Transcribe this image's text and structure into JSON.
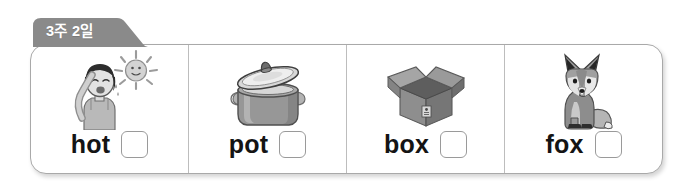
{
  "worksheet": {
    "tab_label": "3주 2일",
    "tab_color": "#8a8a8a",
    "tab_text_color": "#ffffff",
    "panel_border_color": "#a9a9a9",
    "divider_color": "#bdbdbd",
    "word_color": "#141414",
    "checkbox_border_color": "#9a9a9a",
    "cells": [
      {
        "word": "hot",
        "illustration": "person-sweating-under-sun-illustration",
        "checkbox_checked": ""
      },
      {
        "word": "pot",
        "illustration": "cooking-pot-with-lid-illustration",
        "checkbox_checked": ""
      },
      {
        "word": "box",
        "illustration": "open-cardboard-box-illustration",
        "checkbox_checked": ""
      },
      {
        "word": "fox",
        "illustration": "sitting-fox-illustration",
        "checkbox_checked": ""
      }
    ]
  }
}
